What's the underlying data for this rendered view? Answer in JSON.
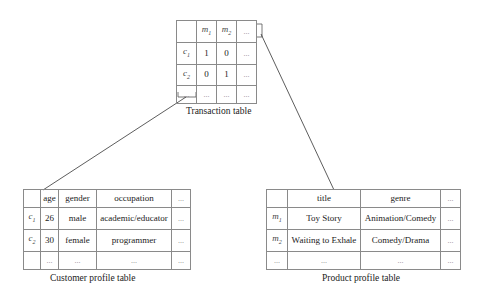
{
  "transaction_table": {
    "caption": "Transaction table",
    "header": [
      "",
      "m1",
      "m2",
      "..."
    ],
    "rows": [
      [
        "c1",
        "1",
        "0",
        "..."
      ],
      [
        "c2",
        "0",
        "1",
        "..."
      ],
      [
        "...",
        "...",
        "...",
        "..."
      ]
    ]
  },
  "customer_table": {
    "caption": "Customer profile table",
    "header": [
      "",
      "age",
      "gender",
      "occupation",
      "..."
    ],
    "rows": [
      [
        "c1",
        "26",
        "male",
        "academic/educator",
        "..."
      ],
      [
        "c2",
        "30",
        "female",
        "programmer",
        "..."
      ],
      [
        "",
        "...",
        "...",
        "...",
        "..."
      ]
    ]
  },
  "product_table": {
    "caption": "Product profile table",
    "header": [
      "",
      "title",
      "genre",
      "..."
    ],
    "rows": [
      [
        "m1",
        "Toy Story",
        "Animation/Comedy",
        "..."
      ],
      [
        "m2",
        "Waiting to Exhale",
        "Comedy/Drama",
        "..."
      ],
      [
        "...",
        "...",
        "...",
        "..."
      ]
    ]
  },
  "colors": {
    "line": "#333333",
    "border": "#8a8a8a"
  }
}
